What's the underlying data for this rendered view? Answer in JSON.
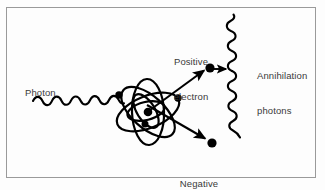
{
  "figure": {
    "background_color": "#fdfdfd",
    "border_color": "#9a9a9a",
    "ink_color": "#000000",
    "text_color": "#3a3a3a"
  },
  "labels": {
    "photon": "Photon",
    "positive_electron_line1": "Positive",
    "positive_electron_line2": "electron",
    "annihilation_line1": "Annihilation",
    "annihilation_line2": "photons",
    "negative_electron_line1": "Negative",
    "negative_electron_line2": "electron"
  },
  "diagram_data": {
    "type": "physics-schematic",
    "process": "pair production followed by positron annihilation",
    "elements": [
      {
        "name": "incident-photon-wave",
        "kind": "wavy-line",
        "from": [
          33,
          101
        ],
        "to": [
          124,
          96
        ],
        "wavelength": 11,
        "amplitude": 5
      },
      {
        "name": "atom",
        "kind": "orbital-model",
        "center": [
          148,
          112
        ],
        "outer_orbit_count": 3,
        "inner_orbit_count": 2,
        "nucleus": [
          148,
          112
        ],
        "orbital_electrons": [
          [
            119,
            95
          ],
          [
            178,
            98
          ],
          [
            145,
            124
          ]
        ]
      },
      {
        "name": "positron-track",
        "kind": "arrow",
        "from": [
          150,
          110
        ],
        "to": [
          206,
          69
        ]
      },
      {
        "name": "positron-particle",
        "kind": "dot",
        "at": [
          210,
          68
        ]
      },
      {
        "name": "annihilation-direction-arrow",
        "kind": "arrow",
        "from": [
          214,
          69
        ],
        "to": [
          228,
          69
        ]
      },
      {
        "name": "annihilation-photon-upper",
        "kind": "wavy-line",
        "from": [
          231,
          70
        ],
        "to": [
          224,
          15
        ],
        "wavelength": 12,
        "amplitude": 5
      },
      {
        "name": "annihilation-photon-lower",
        "kind": "wavy-line",
        "from": [
          231,
          72
        ],
        "to": [
          240,
          137
        ],
        "wavelength": 12,
        "amplitude": 5
      },
      {
        "name": "electron-track",
        "kind": "arrow",
        "from": [
          147,
          105
        ],
        "to": [
          208,
          140
        ]
      },
      {
        "name": "electron-particle",
        "kind": "dot",
        "at": [
          212,
          143
        ]
      }
    ]
  }
}
